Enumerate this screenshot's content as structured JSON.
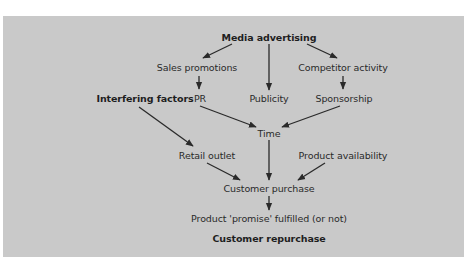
{
  "diagram": {
    "colors": {
      "panel": "#c9c9c9",
      "text": "#2a2a2a",
      "arrow": "#2a2a2a"
    },
    "nodes": {
      "media_advertising": "Media advertising",
      "sales_promotions": "Sales promotions",
      "competitor_activity": "Competitor activity",
      "interfering_factors": "Interfering factors",
      "pr": "PR",
      "publicity": "Publicity",
      "sponsorship": "Sponsorship",
      "time": "Time",
      "retail_outlet": "Retail outlet",
      "product_availability": "Product availability",
      "customer_purchase": "Customer purchase",
      "product_promise": "Product 'promise' fulfilled (or not)",
      "customer_repurchase": "Customer repurchase"
    },
    "edges": [
      [
        "Media advertising",
        "Sales promotions"
      ],
      [
        "Media advertising",
        "Publicity"
      ],
      [
        "Media advertising",
        "Competitor activity"
      ],
      [
        "Sales promotions",
        "PR"
      ],
      [
        "Competitor activity",
        "Sponsorship"
      ],
      [
        "PR",
        "Time"
      ],
      [
        "Sponsorship",
        "Time"
      ],
      [
        "Interfering factors",
        "Retail outlet"
      ],
      [
        "Time",
        "Customer purchase"
      ],
      [
        "Retail outlet",
        "Customer purchase"
      ],
      [
        "Product availability",
        "Customer purchase"
      ],
      [
        "Customer purchase",
        "Product 'promise' fulfilled (or not)"
      ]
    ]
  }
}
